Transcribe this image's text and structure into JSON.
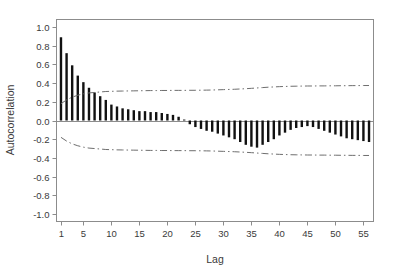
{
  "figure": {
    "background_color": "#ffffff",
    "frame_color": "#8c8c8c",
    "bar_color": "#111111",
    "band_color": "#6e6e6e",
    "text_color": "#3a3a3a"
  },
  "chart_data": {
    "type": "bar",
    "title": "",
    "subtitle": "",
    "xlabel": "Lag",
    "ylabel": "Autocorrelation",
    "xlim": [
      0.2,
      56.8
    ],
    "ylim": [
      -1.08,
      1.08
    ],
    "grid": false,
    "legend": null,
    "xticks": [
      1,
      5,
      10,
      15,
      20,
      25,
      30,
      35,
      40,
      45,
      50,
      55
    ],
    "xtick_labels": [
      "1",
      "5",
      "10",
      "15",
      "20",
      "25",
      "30",
      "35",
      "40",
      "45",
      "50",
      "55"
    ],
    "yticks": [
      1.0,
      0.8,
      0.6,
      0.4,
      0.2,
      0.0,
      -0.2,
      -0.4,
      -0.6,
      -0.8,
      -1.0
    ],
    "ytick_labels": [
      "1.0",
      "0.8",
      "0.6",
      "0.4",
      "0.2",
      "0.0",
      "-0.2",
      "-0.4",
      "-0.6",
      "-0.8",
      "-1.0"
    ],
    "zero_line": 0.0,
    "categories": [
      1,
      2,
      3,
      4,
      5,
      6,
      7,
      8,
      9,
      10,
      11,
      12,
      13,
      14,
      15,
      16,
      17,
      18,
      19,
      20,
      21,
      22,
      23,
      24,
      25,
      26,
      27,
      28,
      29,
      30,
      31,
      32,
      33,
      34,
      35,
      36,
      37,
      38,
      39,
      40,
      41,
      42,
      43,
      44,
      45,
      46,
      47,
      48,
      49,
      50,
      51,
      52,
      53,
      54,
      55,
      56
    ],
    "values": [
      0.89,
      0.72,
      0.59,
      0.48,
      0.41,
      0.35,
      0.3,
      0.26,
      0.22,
      0.17,
      0.15,
      0.13,
      0.12,
      0.11,
      0.1,
      0.1,
      0.09,
      0.09,
      0.08,
      0.07,
      0.06,
      0.04,
      0.01,
      -0.04,
      -0.07,
      -0.09,
      -0.11,
      -0.12,
      -0.14,
      -0.16,
      -0.18,
      -0.2,
      -0.23,
      -0.26,
      -0.28,
      -0.29,
      -0.26,
      -0.23,
      -0.2,
      -0.16,
      -0.13,
      -0.1,
      -0.08,
      -0.07,
      -0.06,
      -0.07,
      -0.09,
      -0.11,
      -0.13,
      -0.15,
      -0.17,
      -0.19,
      -0.2,
      -0.21,
      -0.22,
      -0.23
    ],
    "confidence_band": {
      "style": "dash-dot",
      "upper": [
        0.18,
        0.22,
        0.25,
        0.27,
        0.285,
        0.295,
        0.3,
        0.305,
        0.31,
        0.312,
        0.314,
        0.315,
        0.316,
        0.317,
        0.318,
        0.319,
        0.32,
        0.32,
        0.321,
        0.321,
        0.322,
        0.322,
        0.322,
        0.323,
        0.323,
        0.324,
        0.325,
        0.326,
        0.328,
        0.33,
        0.332,
        0.334,
        0.337,
        0.34,
        0.344,
        0.348,
        0.352,
        0.356,
        0.359,
        0.362,
        0.364,
        0.366,
        0.367,
        0.368,
        0.369,
        0.369,
        0.37,
        0.37,
        0.371,
        0.371,
        0.372,
        0.372,
        0.373,
        0.373,
        0.374,
        0.374
      ],
      "lower": [
        -0.18,
        -0.22,
        -0.25,
        -0.27,
        -0.285,
        -0.295,
        -0.3,
        -0.305,
        -0.31,
        -0.312,
        -0.314,
        -0.315,
        -0.316,
        -0.317,
        -0.318,
        -0.319,
        -0.32,
        -0.32,
        -0.321,
        -0.321,
        -0.322,
        -0.322,
        -0.322,
        -0.323,
        -0.323,
        -0.324,
        -0.325,
        -0.326,
        -0.328,
        -0.33,
        -0.332,
        -0.334,
        -0.337,
        -0.34,
        -0.344,
        -0.348,
        -0.352,
        -0.356,
        -0.359,
        -0.362,
        -0.364,
        -0.366,
        -0.367,
        -0.368,
        -0.369,
        -0.369,
        -0.37,
        -0.37,
        -0.371,
        -0.371,
        -0.372,
        -0.372,
        -0.373,
        -0.373,
        -0.374,
        -0.374
      ]
    }
  }
}
